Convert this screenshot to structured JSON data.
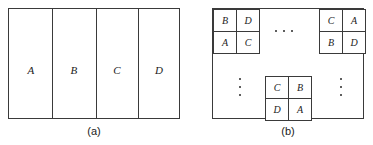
{
  "figure": {
    "background_color": "#ffffff",
    "line_color": "#3a3a3a",
    "text_color": "#1b1b1b"
  },
  "panel_a": {
    "caption": "(a)",
    "columns": [
      {
        "label": "A"
      },
      {
        "label": "B"
      },
      {
        "label": "C"
      },
      {
        "label": "D"
      }
    ]
  },
  "panel_b": {
    "caption": "(b)",
    "blocks": [
      {
        "position": "top-left",
        "cells": [
          {
            "label": "B"
          },
          {
            "label": "D"
          },
          {
            "label": "A"
          },
          {
            "label": "C"
          }
        ]
      },
      {
        "position": "top-right",
        "cells": [
          {
            "label": "C"
          },
          {
            "label": "A"
          },
          {
            "label": "B"
          },
          {
            "label": "D"
          }
        ]
      },
      {
        "position": "center-bottom",
        "cells": [
          {
            "label": "C"
          },
          {
            "label": "B"
          },
          {
            "label": "D"
          },
          {
            "label": "A"
          }
        ]
      }
    ],
    "ellipses": [
      {
        "name": "horizontal-top",
        "glyph": "..."
      },
      {
        "name": "vertical-left",
        "glyph": "⋮"
      },
      {
        "name": "vertical-right",
        "glyph": "⋮"
      }
    ]
  }
}
